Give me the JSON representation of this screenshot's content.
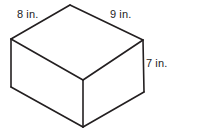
{
  "figure": {
    "name": "rectangular-prism-diagram",
    "shape_type": "rectangular prism",
    "background_color": "#ffffff",
    "line_color": "#231f20",
    "line_width": 1.6,
    "labels": {
      "top_left_edge": "8 in.",
      "top_right_edge": "9 in.",
      "vertical_edge": "7 in."
    },
    "dimensions": {
      "width_label": "8 in.",
      "length_label": "9 in.",
      "height_label": "7 in."
    },
    "geometry": {
      "top_apex": [
        70,
        5
      ],
      "left_vertex": [
        11,
        39
      ],
      "right_vertex": [
        143,
        40
      ],
      "front_top_center": [
        83,
        80
      ],
      "bottom_left": [
        11,
        87
      ],
      "bottom_right": [
        144,
        92
      ],
      "bottom_center": [
        83,
        127
      ]
    }
  }
}
